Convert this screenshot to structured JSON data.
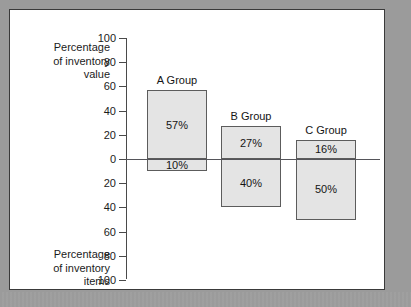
{
  "figure": {
    "panel_background": "#ffffff",
    "mat_color": "#9b9b9b",
    "border_color": "#3a3a3a"
  },
  "labels": {
    "top_axis_title_line1": "Percentage",
    "top_axis_title_line2": "of inventory",
    "top_axis_title_line3": "value",
    "bottom_axis_title_line1": "Percentage",
    "bottom_axis_title_line2": "of inventory",
    "bottom_axis_title_line3": "items"
  },
  "axis": {
    "ticks": [
      "100",
      "80",
      "60",
      "40",
      "20",
      "0",
      "20",
      "40",
      "60",
      "80",
      "100"
    ],
    "zero_index": 5
  },
  "groups": [
    {
      "caption": "A Group",
      "value_label": "57%",
      "items_label": "10%",
      "value_pct": 57,
      "items_pct": 10
    },
    {
      "caption": "B Group",
      "value_label": "27%",
      "items_label": "40%",
      "value_pct": 27,
      "items_pct": 40
    },
    {
      "caption": "C Group",
      "value_label": "16%",
      "items_label": "50%",
      "value_pct": 16,
      "items_pct": 50
    }
  ],
  "chart_data": {
    "type": "bar",
    "title": "",
    "subtitle": "",
    "orientation": "vertical",
    "categories": [
      "A Group",
      "B Group",
      "C Group"
    ],
    "series": [
      {
        "name": "Percentage of inventory value",
        "direction": "up",
        "values": [
          57,
          27,
          16
        ],
        "data_labels": [
          "57%",
          "27%",
          "16%"
        ]
      },
      {
        "name": "Percentage of inventory items",
        "direction": "down",
        "values": [
          10,
          40,
          50
        ],
        "data_labels": [
          "10%",
          "40%",
          "50%"
        ]
      }
    ],
    "xlabel": "",
    "ylabel_top": "Percentage of inventory value",
    "ylabel_bottom": "Percentage of inventory items",
    "ytick_labels": [
      "100",
      "80",
      "60",
      "40",
      "20",
      "0",
      "20",
      "40",
      "60",
      "80",
      "100"
    ],
    "ytick_values_up": [
      100,
      80,
      60,
      40,
      20,
      0
    ],
    "ytick_values_down": [
      20,
      40,
      60,
      80,
      100
    ],
    "ylim": [
      -100,
      100
    ],
    "grid": false,
    "legend": "none",
    "bar_fill": "#e4e4e4",
    "bar_border": "#5c5c5c",
    "baseline_color": "#55555a"
  }
}
